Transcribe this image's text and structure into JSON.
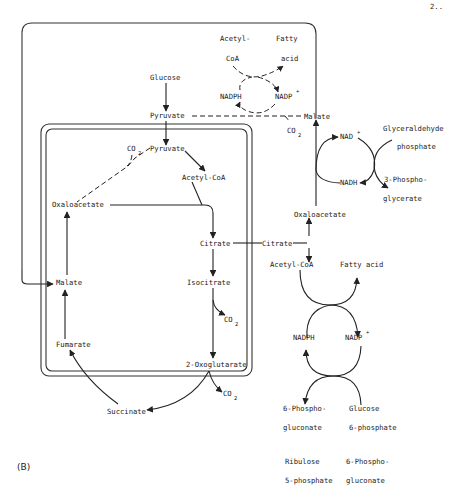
{
  "figure": {
    "panel_label": "(B)",
    "page_number": "2..",
    "compartments": {
      "cytosol_outer_box": "cytosol",
      "mitochondrion_box": "mitochondrion"
    },
    "labels": {
      "acetyl_coa_top_1": "Acetyl-",
      "acetyl_coa_top_2": "CoA",
      "fatty_acid_top_1": "Fatty",
      "fatty_acid_top_2": "acid",
      "nadph_top": "NADPH",
      "nadp_top": "NADP",
      "glucose": "Glucose",
      "pyruvate_cyt": "Pyruvate",
      "malate_cyt": "Malate",
      "co2_malic": "CO",
      "nad_plus": "NAD",
      "nadh": "NADH",
      "glyceraldehyde_1": "Glyceraldehyde",
      "glyceraldehyde_2": "phosphate",
      "phosphoglycerate_1": "3-Phospho-",
      "phosphoglycerate_2": "glycerate",
      "pyruvate_mito": "Pyruvate",
      "co2_pc": "CO",
      "acetyl_coa_mito": "Acetyl-CoA",
      "oxaloacetate_mito": "Oxaloacetate",
      "citrate_mito": "Citrate",
      "malate_mito": "Malate",
      "isocitrate": "Isocitrate",
      "co2_idh": "CO",
      "fumarate": "Fumarate",
      "oxoglutarate": "2-Oxoglutarate",
      "co2_ogdh": "CO",
      "succinate": "Succinate",
      "oxaloacetate_cyt": "Oxaloacetate",
      "citrate_cyt": "Citrate",
      "acetyl_coa_cyt": "Acetyl-CoA",
      "fatty_acid_cyt": "Fatty acid",
      "nadph_low": "NADPH",
      "nadp_low": "NADP",
      "phosphogluconate_1": "6-Phospho-",
      "phosphogluconate_2": "gluconate",
      "glucose6p_1": "Glucose",
      "glucose6p_2": "6-phosphate",
      "ribulose_1": "Ribulose",
      "ribulose_2": "5-phosphate",
      "phosphogluconate_b1": "6-Phospho-",
      "phosphogluconate_b2": "gluconate",
      "sub2": "2",
      "plus": "+"
    }
  }
}
